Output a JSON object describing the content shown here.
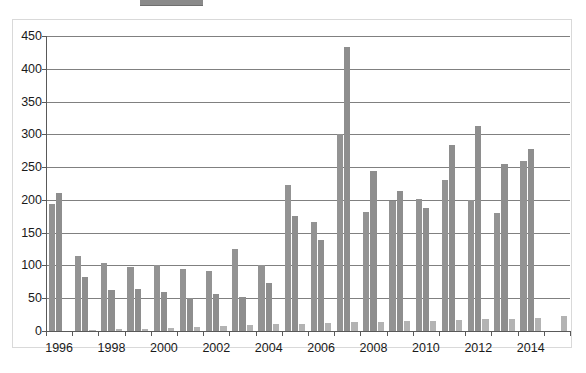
{
  "chart": {
    "title": "",
    "subtitle": "",
    "legend_swatch": "legend-swatch-cropped"
  },
  "chart_data": {
    "type": "bar",
    "title": "",
    "xlabel": "",
    "ylabel": "",
    "ylim": [
      0,
      450
    ],
    "yticks": [
      0,
      50,
      100,
      150,
      200,
      250,
      300,
      350,
      400,
      450
    ],
    "ytick_labels": [
      "0",
      "50",
      "100",
      "150",
      "200",
      "250",
      "300",
      "350",
      "400",
      "450"
    ],
    "grid": true,
    "legend_position": "top",
    "categories": [
      "1996",
      "1997",
      "1998",
      "1999",
      "2000",
      "2001",
      "2002",
      "2003",
      "2004",
      "2005",
      "2006",
      "2007",
      "2008",
      "2009",
      "2010",
      "2011",
      "2012",
      "2013",
      "2014",
      "2015"
    ],
    "xtick_labels": [
      "1996",
      "1998",
      "2000",
      "2002",
      "2004",
      "2006",
      "2008",
      "2010",
      "2012",
      "2014"
    ],
    "series": [
      {
        "name": "series-1",
        "color": "#939393",
        "values": [
          194,
          114,
          104,
          98,
          101,
          94,
          91,
          125,
          101,
          222,
          166,
          301,
          181,
          199,
          201,
          231,
          200,
          180,
          260,
          0
        ]
      },
      {
        "name": "series-2",
        "color": "#8e8e8e",
        "values": [
          211,
          82,
          62,
          64,
          60,
          51,
          56,
          52,
          73,
          176,
          139,
          434,
          244,
          213,
          188,
          283,
          312,
          255,
          277,
          0
        ]
      },
      {
        "name": "series-3",
        "color": "#b3b3b3",
        "values": [
          0,
          2,
          3,
          3,
          5,
          6,
          8,
          9,
          10,
          11,
          12,
          13,
          14,
          15,
          16,
          17,
          18,
          19,
          20,
          23
        ]
      }
    ]
  },
  "colors": {
    "bar_primary": "#939393",
    "bar_secondary": "#8e8e8e",
    "bar_tertiary": "#b3b3b3",
    "gridline": "#808080",
    "axis": "#595959",
    "frame": "#d9d9d9",
    "text": "#1a1a1a",
    "background": "#ffffff"
  }
}
